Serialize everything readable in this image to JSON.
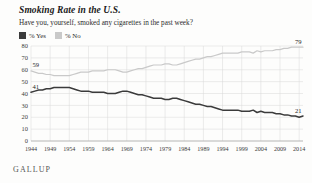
{
  "chart_data": {
    "type": "line",
    "title": "Smoking Rate in the U.S.",
    "subtitle": "Have you, yourself, smoked any cigarettes in the past week?",
    "xlabel": "",
    "ylabel": "",
    "ylim": [
      0,
      80
    ],
    "xlim": [
      1944,
      2015
    ],
    "grid": true,
    "legend_position": "top-left",
    "source": "GALLUP",
    "yticks": [
      0,
      10,
      20,
      30,
      40,
      50,
      60,
      70,
      80
    ],
    "xticks": [
      1944,
      1949,
      1954,
      1959,
      1964,
      1969,
      1974,
      1979,
      1984,
      1989,
      1994,
      1999,
      2004,
      2009,
      2014
    ],
    "annotations": [
      {
        "text": "59",
        "series": "% No",
        "x": 1944,
        "y": 59
      },
      {
        "text": "41",
        "series": "% Yes",
        "x": 1944,
        "y": 41
      },
      {
        "text": "79",
        "series": "% No",
        "x": 2015,
        "y": 79
      },
      {
        "text": "21",
        "series": "% Yes",
        "x": 2015,
        "y": 21
      }
    ],
    "series": [
      {
        "name": "% Yes",
        "color": "#3b3b3b",
        "points": [
          [
            1944,
            41
          ],
          [
            1945,
            42
          ],
          [
            1946,
            43
          ],
          [
            1947,
            43
          ],
          [
            1948,
            44
          ],
          [
            1949,
            44
          ],
          [
            1950,
            45
          ],
          [
            1951,
            45
          ],
          [
            1952,
            45
          ],
          [
            1953,
            45
          ],
          [
            1954,
            45
          ],
          [
            1955,
            44
          ],
          [
            1956,
            43
          ],
          [
            1957,
            42
          ],
          [
            1958,
            42
          ],
          [
            1959,
            42
          ],
          [
            1960,
            41
          ],
          [
            1961,
            41
          ],
          [
            1962,
            41
          ],
          [
            1963,
            41
          ],
          [
            1964,
            40
          ],
          [
            1965,
            40
          ],
          [
            1966,
            40
          ],
          [
            1967,
            41
          ],
          [
            1968,
            42
          ],
          [
            1969,
            42
          ],
          [
            1970,
            41
          ],
          [
            1971,
            40
          ],
          [
            1972,
            39
          ],
          [
            1973,
            39
          ],
          [
            1974,
            38
          ],
          [
            1975,
            37
          ],
          [
            1976,
            36
          ],
          [
            1977,
            36
          ],
          [
            1978,
            36
          ],
          [
            1979,
            35
          ],
          [
            1980,
            35
          ],
          [
            1981,
            36
          ],
          [
            1982,
            36
          ],
          [
            1983,
            35
          ],
          [
            1984,
            34
          ],
          [
            1985,
            33
          ],
          [
            1986,
            32
          ],
          [
            1987,
            31
          ],
          [
            1988,
            31
          ],
          [
            1989,
            30
          ],
          [
            1990,
            29
          ],
          [
            1991,
            29
          ],
          [
            1992,
            28
          ],
          [
            1993,
            27
          ],
          [
            1994,
            26
          ],
          [
            1995,
            26
          ],
          [
            1996,
            26
          ],
          [
            1997,
            26
          ],
          [
            1998,
            26
          ],
          [
            1999,
            25
          ],
          [
            2000,
            25
          ],
          [
            2001,
            25
          ],
          [
            2002,
            26
          ],
          [
            2003,
            24
          ],
          [
            2004,
            25
          ],
          [
            2005,
            24
          ],
          [
            2006,
            24
          ],
          [
            2007,
            24
          ],
          [
            2008,
            23
          ],
          [
            2009,
            23
          ],
          [
            2010,
            22
          ],
          [
            2011,
            22
          ],
          [
            2012,
            21
          ],
          [
            2013,
            21
          ],
          [
            2014,
            20
          ],
          [
            2015,
            21
          ]
        ]
      },
      {
        "name": "% No",
        "color": "#c9c9c9",
        "points": [
          [
            1944,
            59
          ],
          [
            1945,
            58
          ],
          [
            1946,
            57
          ],
          [
            1947,
            57
          ],
          [
            1948,
            56
          ],
          [
            1949,
            56
          ],
          [
            1950,
            55
          ],
          [
            1951,
            55
          ],
          [
            1952,
            55
          ],
          [
            1953,
            55
          ],
          [
            1954,
            55
          ],
          [
            1955,
            56
          ],
          [
            1956,
            57
          ],
          [
            1957,
            58
          ],
          [
            1958,
            58
          ],
          [
            1959,
            58
          ],
          [
            1960,
            59
          ],
          [
            1961,
            59
          ],
          [
            1962,
            59
          ],
          [
            1963,
            59
          ],
          [
            1964,
            60
          ],
          [
            1965,
            60
          ],
          [
            1966,
            60
          ],
          [
            1967,
            59
          ],
          [
            1968,
            58
          ],
          [
            1969,
            58
          ],
          [
            1970,
            59
          ],
          [
            1971,
            60
          ],
          [
            1972,
            61
          ],
          [
            1973,
            61
          ],
          [
            1974,
            62
          ],
          [
            1975,
            63
          ],
          [
            1976,
            64
          ],
          [
            1977,
            64
          ],
          [
            1978,
            64
          ],
          [
            1979,
            65
          ],
          [
            1980,
            65
          ],
          [
            1981,
            64
          ],
          [
            1982,
            64
          ],
          [
            1983,
            65
          ],
          [
            1984,
            66
          ],
          [
            1985,
            67
          ],
          [
            1986,
            68
          ],
          [
            1987,
            69
          ],
          [
            1988,
            69
          ],
          [
            1989,
            70
          ],
          [
            1990,
            71
          ],
          [
            1991,
            71
          ],
          [
            1992,
            72
          ],
          [
            1993,
            73
          ],
          [
            1994,
            74
          ],
          [
            1995,
            74
          ],
          [
            1996,
            74
          ],
          [
            1997,
            74
          ],
          [
            1998,
            74
          ],
          [
            1999,
            75
          ],
          [
            2000,
            75
          ],
          [
            2001,
            75
          ],
          [
            2002,
            74
          ],
          [
            2003,
            76
          ],
          [
            2004,
            75
          ],
          [
            2005,
            76
          ],
          [
            2006,
            76
          ],
          [
            2007,
            76
          ],
          [
            2008,
            77
          ],
          [
            2009,
            77
          ],
          [
            2010,
            78
          ],
          [
            2011,
            78
          ],
          [
            2012,
            79
          ],
          [
            2013,
            79
          ],
          [
            2014,
            79
          ],
          [
            2015,
            79
          ]
        ]
      }
    ]
  },
  "legend": {
    "items": [
      {
        "label": "% Yes",
        "color": "#3b3b3b"
      },
      {
        "label": "% No",
        "color": "#c9c9c9"
      }
    ]
  },
  "footer": {
    "brand": "GALLUP"
  }
}
